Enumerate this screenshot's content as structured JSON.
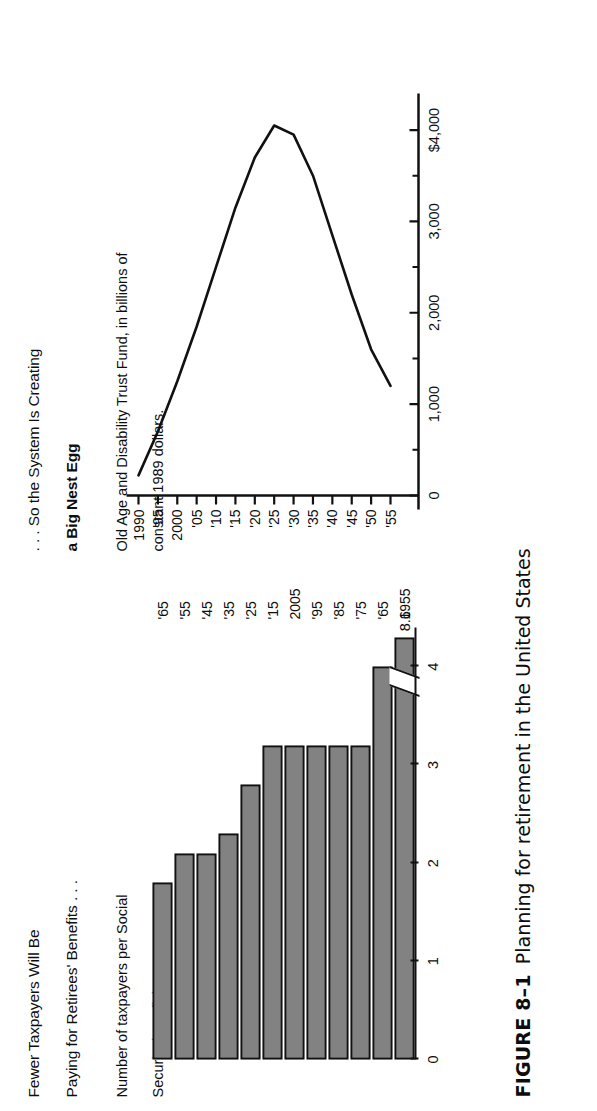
{
  "figure": {
    "caption_number": "FIGURE 8–1",
    "caption_text": "Planning for retirement in the United States"
  },
  "bar_panel": {
    "title_line1": "Fewer Taxpayers Will Be",
    "title_line2": "Paying for Retirees' Benefits . . .",
    "subtitle_line1": "Number of taxpayers per Social",
    "subtitle_line2": "Security beneficiary.",
    "break_value_label": "8.6"
  },
  "line_panel": {
    "title_line1": ". . . So the System Is Creating",
    "title_line2": "a Big Nest Egg",
    "subtitle_line1": "Old Age and Disability Trust Fund, in billions of",
    "subtitle_line2": "constant 1989 dollars."
  },
  "chart_data": [
    {
      "type": "bar",
      "title": "Fewer Taxpayers Will Be Paying for Retirees' Benefits . . .",
      "subtitle": "Number of taxpayers per Social Security beneficiary.",
      "orientation": "horizontal",
      "xlabel": "",
      "ylabel": "Number of taxpayers per Social Security beneficiary",
      "categories": [
        "1955",
        "'65",
        "'75",
        "'85",
        "'95",
        "2005",
        "'15",
        "'25",
        "'35",
        "'45",
        "'55",
        "'65"
      ],
      "values": [
        8.6,
        4.0,
        3.2,
        3.2,
        3.2,
        3.2,
        3.2,
        2.8,
        2.3,
        2.1,
        2.1,
        1.8
      ],
      "value_tick_labels": [
        "0",
        "1",
        "2",
        "3",
        "4"
      ],
      "value_ticks": [
        0,
        1,
        2,
        3,
        4
      ],
      "ylim": [
        0,
        4.4
      ],
      "axis_break": true,
      "axis_break_note": "1955 bar is broken; true value 8.6",
      "data_labels": {
        "1955": "8.6"
      },
      "grid": false,
      "legend": "none",
      "bar_fill": "#cfcfcf",
      "bar_stroke": "#111111"
    },
    {
      "type": "line",
      "title": ". . . So the System Is Creating a Big Nest Egg",
      "subtitle": "Old Age and Disability Trust Fund, in billions of constant 1989 dollars.",
      "xlabel": "",
      "ylabel": "Billions of constant 1989 dollars",
      "x": [
        "1990",
        "'95",
        "2000",
        "'05",
        "'10",
        "'15",
        "'20",
        "'25",
        "'30",
        "'35",
        "'40",
        "'45",
        "'50",
        "'55"
      ],
      "x_tick_labels": [
        "1990",
        "'95",
        "2000",
        "'05",
        "'10",
        "'15",
        "'20",
        "'25",
        "'30",
        "'35",
        "'40",
        "'45",
        "'50",
        "'55"
      ],
      "y_tick_labels": [
        "0",
        "1,000",
        "2,000",
        "3,000",
        "$4,000"
      ],
      "y_ticks": [
        0,
        1000,
        2000,
        3000,
        4000
      ],
      "ylim": [
        0,
        4400
      ],
      "values": [
        220,
        700,
        1250,
        1850,
        2500,
        3150,
        3700,
        4050,
        3950,
        3500,
        2850,
        2200,
        1600,
        1200
      ],
      "grid": false,
      "legend": "none",
      "line_color": "#111111"
    }
  ]
}
